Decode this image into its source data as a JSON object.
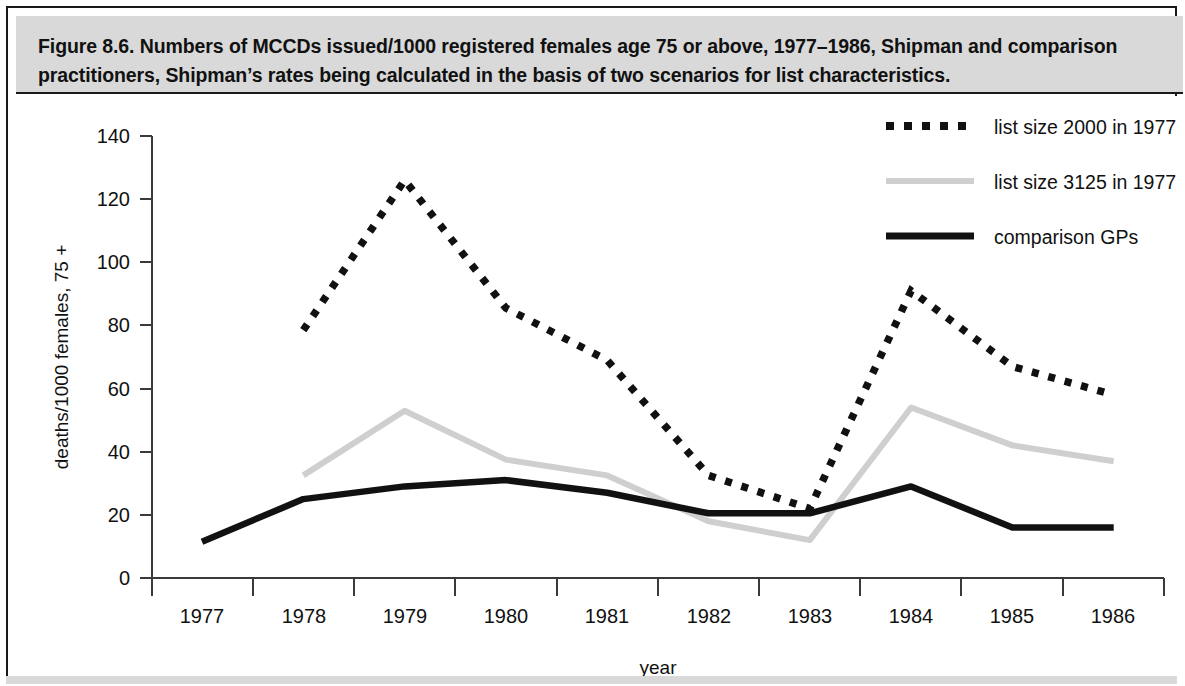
{
  "figure": {
    "caption": "Figure 8.6. Numbers of MCCDs issued/1000 registered females age 75 or above, 1977–1986, Shipman and comparison practitioners, Shipman’s rates being calculated in the basis of two scenarios for list characteristics."
  },
  "colors": {
    "series_dotted": "#111111",
    "series_gray": "#cfcfcf",
    "series_solid": "#111111",
    "axis": "#3a3a3a",
    "caption_band": "#d9d9d9",
    "frame": "#1a1a1a",
    "background": "#ffffff"
  },
  "chart_data": {
    "type": "line",
    "title": "",
    "xlabel": "year",
    "ylabel": "deaths/1000 females, 75 +",
    "categories": [
      "1977",
      "1978",
      "1979",
      "1980",
      "1981",
      "1982",
      "1983",
      "1984",
      "1985",
      "1986"
    ],
    "x": [
      1977,
      1978,
      1979,
      1980,
      1981,
      1982,
      1983,
      1984,
      1985,
      1986
    ],
    "xlim": [
      1976.6,
      1986.6
    ],
    "ylim": [
      0,
      140
    ],
    "yticks": [
      0,
      20,
      40,
      60,
      80,
      100,
      120,
      140
    ],
    "ytick_labels": [
      "0",
      "20",
      "40",
      "60",
      "80",
      "100",
      "120",
      "140"
    ],
    "grid": false,
    "legend_position": "top-right",
    "series": [
      {
        "name": "list size 2000 in 1977",
        "style": "dotted",
        "color": "#111111",
        "values": [
          null,
          78.5,
          126.0,
          85.5,
          69.0,
          32.5,
          22.0,
          91.0,
          67.0,
          58.0
        ]
      },
      {
        "name": "list size 3125 in 1977",
        "style": "solid-light",
        "color": "#cfcfcf",
        "values": [
          null,
          32.5,
          53.0,
          37.5,
          32.5,
          18.0,
          12.0,
          54.0,
          42.0,
          37.0
        ]
      },
      {
        "name": "comparison GPs",
        "style": "solid-thick",
        "color": "#111111",
        "values": [
          11.5,
          25.0,
          29.0,
          31.0,
          27.0,
          20.5,
          20.5,
          29.0,
          16.0,
          16.0
        ]
      }
    ]
  },
  "legend": {
    "items": [
      {
        "label": "list size 2000 in 1977",
        "swatch": "dotted-swatch"
      },
      {
        "label": "list size 3125 in 1977",
        "swatch": "gray-line-swatch"
      },
      {
        "label": "comparison GPs",
        "swatch": "solid-line-swatch"
      }
    ]
  }
}
